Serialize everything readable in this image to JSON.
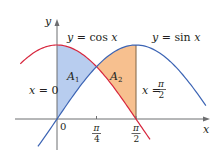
{
  "chart_data": {
    "type": "line",
    "title": "",
    "xlabel": "x",
    "ylabel": "y",
    "series": [
      {
        "name": "y = cos x",
        "function": "cos",
        "color": "#d7263d",
        "x_range": [
          -0.73,
          1.85
        ]
      },
      {
        "name": "y = sin x",
        "function": "sin",
        "color": "#3c64b4",
        "x_range": [
          -0.38,
          2.96
        ]
      }
    ],
    "regions": [
      {
        "name": "A1",
        "x_range": [
          0,
          0.7854
        ],
        "lower": "sin",
        "upper": "cos",
        "color": "#b8cdef"
      },
      {
        "name": "A2",
        "x_range": [
          0.7854,
          1.5708
        ],
        "lower": "cos",
        "upper": "sin",
        "color": "#f7c08f"
      }
    ],
    "x_ticks": [
      {
        "value": 0,
        "label": "0"
      },
      {
        "value": 0.7854,
        "label": "π/4"
      },
      {
        "value": 1.5708,
        "label": "π/2"
      }
    ],
    "vertical_lines": [
      {
        "x": 0,
        "label": "x = 0"
      },
      {
        "x": 1.5708,
        "label": "x = π/2"
      }
    ],
    "grid": false
  },
  "labels": {
    "y_axis": "y",
    "x_axis": "x",
    "cos_label_lhs": "y",
    "cos_label_eq": " = cos ",
    "cos_label_var": "x",
    "sin_label_lhs": "y",
    "sin_label_eq": " = sin ",
    "sin_label_var": "x",
    "a1": "A",
    "a1_sub": "1",
    "a2": "A",
    "a2_sub": "2",
    "x_eq_0_var": "x",
    "x_eq_0_rest": " = 0",
    "x_eq_pi2_var": "x",
    "x_eq_pi2_eq": " =",
    "pi": "π",
    "two": "2",
    "four": "4",
    "zero": "0"
  },
  "colors": {
    "cos": "#d7263d",
    "sin": "#3c64b4",
    "region_a1": "#b8cdef",
    "region_a2": "#f7c08f",
    "axis": "#6d6e70",
    "boundary": "#8a6d4f"
  }
}
